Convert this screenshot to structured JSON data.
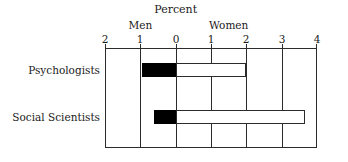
{
  "chart_data": {
    "type": "bar",
    "orientation": "horizontal",
    "layout": "diverging",
    "title": "Percent",
    "xlabel": "",
    "ylabel": "",
    "grid": true,
    "legend_position": "above-axis",
    "group_labels": [
      {
        "name": "Men",
        "side": "left",
        "at": -1
      },
      {
        "name": "Women",
        "side": "right",
        "at": 1.5
      }
    ],
    "axis": {
      "ticks": [
        -2,
        -1,
        0,
        1,
        2,
        3,
        4
      ],
      "tick_labels": [
        "2",
        "1",
        "0",
        "1",
        "2",
        "3",
        "4"
      ],
      "xlim": [
        -2,
        4
      ]
    },
    "categories": [
      "Psychologists",
      "Social Scientists"
    ],
    "series": [
      {
        "name": "Men",
        "values": [
          0.95,
          0.62
        ]
      },
      {
        "name": "Women",
        "values": [
          2.0,
          3.65
        ]
      }
    ]
  }
}
